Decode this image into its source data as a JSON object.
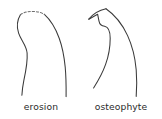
{
  "figure": {
    "background_color": "#ffffff",
    "stroke_color": "#3a3a3a",
    "dashed_stroke_color": "#6e6e6e",
    "caption_color": "#2b2b2b",
    "width_px": 162,
    "height_px": 119
  },
  "panels": [
    {
      "id": "erosion",
      "caption": "erosion",
      "description": "Bone cortex profile whose convex superior margin is drawn as a dashed arc, indicating a loss of bone surface; the medial border shows a concave notch.",
      "marker_style": "dashed-arc",
      "paths": {
        "medial_border": "M 20.5 14.6 C 17.0 20.5 16.6 27.2 18.6 33.2 C 21.0 40.4 26.5 45.6 27.1 53.0 C 27.8 62.0 25.8 71.4 23.8 80.6 C 22.9 85.0 22.2 90.3 21.9 95.2",
        "lateral_border": "M 44.4 14.4 C 50.6 20.0 55.6 28.4 59.2 38.2 C 62.4 47.0 64.2 56.8 65.2 67.0 C 66.0 75.6 66.2 86.6 66.1 96.6",
        "eroded_arc": "M 20.5 14.6 C 23.4 12.6 27.6 11.4 32.0 11.4 C 37.0 11.4 41.4 12.5 44.4 14.4"
      }
    },
    {
      "id": "osteophyte",
      "caption": "osteophyte",
      "description": "Bone cortex profile with a sharp bony outgrowth (spur) projecting from the medial margin near the joint surface; the outline is continuous.",
      "marker_style": "solid-spur",
      "paths": {
        "medial_border": "M 8.8 19.2 L 17.6 14.2 L 19.0 21.2 C 19.6 24.4 21.3 26.0 24.6 26.2 C 28.8 27.0 30.2 31.6 30.2 38.2 C 30.2 47.0 28.6 56.0 25.6 64.4 C 22.8 72.4 18.4 80.4 13.6 88.0",
        "lateral_border": "M 26.0 8.8 C 34.4 14.6 42.2 24.0 47.6 35.6 C 52.6 46.4 55.2 58.2 56.2 69.8 C 56.9 78.4 56.8 88.0 56.2 96.4",
        "spur_tip": "M 8.8 19.2 C 13.0 14.0 19.2 10.2 26.0 8.8"
      }
    }
  ]
}
